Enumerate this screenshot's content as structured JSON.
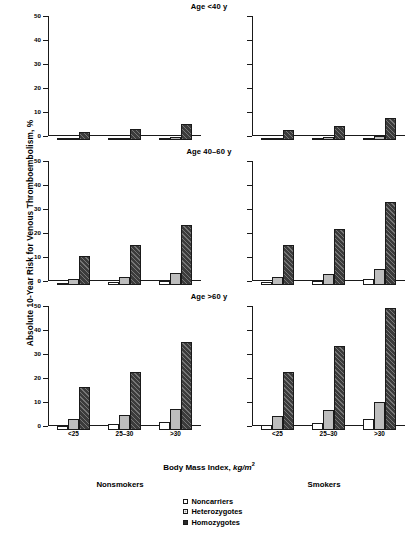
{
  "figure": {
    "y_axis_title": "Absolute 10-Year Risk for Venous Thromboembolism, %",
    "x_axis_title_main": "Body Mass Index, ",
    "x_axis_title_units": "kg/m",
    "x_axis_title_exponent": "2",
    "caption": ""
  },
  "column_labels": {
    "nonsmokers": "Nonsmokers",
    "smokers": "Smokers"
  },
  "legend": {
    "items": [
      {
        "key": "noncarriers",
        "label": "Noncarriers",
        "swatch": "open-square-icon",
        "color": "#ffffff"
      },
      {
        "key": "heterozygotes",
        "label": "Heterozygotes",
        "swatch": "grey-square-icon",
        "color": "#bdbdbd"
      },
      {
        "key": "homozygotes",
        "label": "Homozygotes",
        "swatch": "hatched-square-icon",
        "color": "#3b3b3b"
      }
    ]
  },
  "axis": {
    "y_ticks": [
      0,
      10,
      20,
      30,
      40,
      50
    ],
    "y_min": 0,
    "y_max": 50,
    "x_categories": [
      "<25",
      "25–30",
      ">30"
    ]
  },
  "panels": [
    {
      "id": "age-lt40",
      "title": "Age <40 y"
    },
    {
      "id": "age-40-60",
      "title": "Age 40–60 y"
    },
    {
      "id": "age-gt60",
      "title": "Age >60 y"
    }
  ],
  "chart_data": {
    "type": "bar",
    "xlabel": "Body Mass Index, kg/m2",
    "ylabel": "Absolute 10-Year Risk for Venous Thromboembolism, %",
    "ylim": [
      0,
      50
    ],
    "yticks": [
      0,
      10,
      20,
      30,
      40,
      50
    ],
    "grid": false,
    "legend_position": "bottom-center",
    "categories": [
      "<25",
      "25–30",
      ">30"
    ],
    "panel_rows": [
      "Age <40 y",
      "Age 40–60 y",
      "Age >60 y"
    ],
    "panel_cols": [
      "Nonsmokers",
      "Smokers"
    ],
    "series_names": [
      "Noncarriers",
      "Heterozygotes",
      "Homozygotes"
    ],
    "panels": [
      {
        "row": "Age <40 y",
        "col": "Nonsmokers",
        "series": [
          {
            "name": "Noncarriers",
            "values": [
              0.3,
              0.4,
              0.5
            ]
          },
          {
            "name": "Heterozygotes",
            "values": [
              0.7,
              0.9,
              1.2
            ]
          },
          {
            "name": "Homozygotes",
            "values": [
              3.2,
              4.4,
              6.7
            ]
          }
        ]
      },
      {
        "row": "Age <40 y",
        "col": "Smokers",
        "series": [
          {
            "name": "Noncarriers",
            "values": [
              0.4,
              0.5,
              0.6
            ]
          },
          {
            "name": "Heterozygotes",
            "values": [
              1.0,
              1.2,
              1.6
            ]
          },
          {
            "name": "Homozygotes",
            "values": [
              4.3,
              6.0,
              9.2
            ]
          }
        ]
      },
      {
        "row": "Age 40–60 y",
        "col": "Nonsmokers",
        "series": [
          {
            "name": "Noncarriers",
            "values": [
              0.9,
              1.2,
              1.8
            ]
          },
          {
            "name": "Heterozygotes",
            "values": [
              2.4,
              3.2,
              4.8
            ]
          },
          {
            "name": "Homozygotes",
            "values": [
              12.2,
              16.8,
              25.2
            ]
          }
        ]
      },
      {
        "row": "Age 40–60 y",
        "col": "Smokers",
        "series": [
          {
            "name": "Noncarriers",
            "values": [
              1.2,
              1.6,
              2.4
            ]
          },
          {
            "name": "Heterozygotes",
            "values": [
              3.2,
              4.4,
              6.5
            ]
          },
          {
            "name": "Homozygotes",
            "values": [
              16.5,
              23.5,
              34.5
            ]
          }
        ]
      },
      {
        "row": "Age >60 y",
        "col": "Nonsmokers",
        "series": [
          {
            "name": "Noncarriers",
            "values": [
              1.7,
              2.4,
              3.3
            ]
          },
          {
            "name": "Heterozygotes",
            "values": [
              4.6,
              6.2,
              8.7
            ]
          },
          {
            "name": "Homozygotes",
            "values": [
              17.8,
              24.3,
              36.5
            ]
          }
        ]
      },
      {
        "row": "Age >60 y",
        "col": "Smokers",
        "series": [
          {
            "name": "Noncarriers",
            "values": [
              2.2,
              3.1,
              4.4
            ]
          },
          {
            "name": "Heterozygotes",
            "values": [
              6.0,
              8.2,
              11.5
            ]
          },
          {
            "name": "Homozygotes",
            "values": [
              24.0,
              34.8,
              51.0
            ]
          }
        ]
      }
    ]
  }
}
